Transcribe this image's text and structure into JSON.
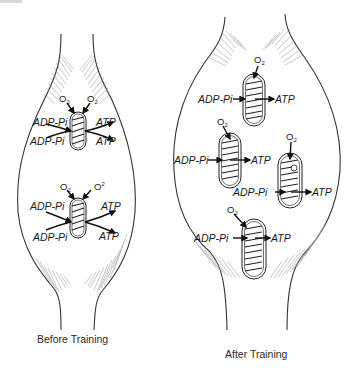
{
  "figure": {
    "left_panel": {
      "caption": "Before Training",
      "mitochondria": [
        {
          "o2_left": "O",
          "o2_left_sub": "2",
          "o2_right": "O",
          "o2_right_sub": "2",
          "inputs": [
            "ADP-Pi",
            "ADP-Pi"
          ],
          "outputs": [
            "ATP",
            "ATP"
          ]
        },
        {
          "o2_left": "O",
          "o2_left_sub": "2",
          "o2_right": "O",
          "o2_right_sup": "2",
          "inputs": [
            "ADP-Pi",
            "ADP-Pi"
          ],
          "outputs": [
            "ATP",
            "ATP"
          ]
        }
      ]
    },
    "right_panel": {
      "caption": "After Training",
      "mitochondria": [
        {
          "o2": "O",
          "o2_sub": "2",
          "input": "ADP-Pi",
          "output": "ATP"
        },
        {
          "o2": "O",
          "o2_sub": "2",
          "input": "ADP-Pi",
          "output": "ATP"
        },
        {
          "o2": "O",
          "o2_sub": "2",
          "input": "ADP-Pi",
          "output": "ATP"
        },
        {
          "o2": "O",
          "o2_sub": "2",
          "input": "ADP-Pi",
          "output": "ATP"
        }
      ]
    }
  },
  "colors": {
    "line": "#333333",
    "hatch": "#9a9a9a",
    "text": "#1a1a1a",
    "background": "#ffffff"
  }
}
